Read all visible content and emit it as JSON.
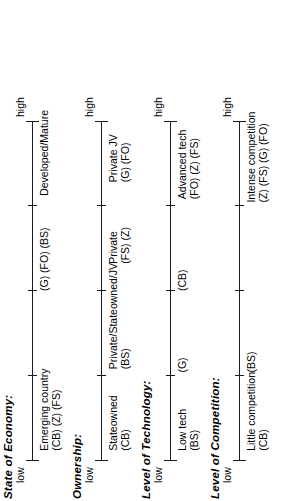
{
  "figure": {
    "orientation": "rotated-90-ccw",
    "scales": [
      {
        "id": "state-of-economy",
        "title": "State of Economy:",
        "low_label": "low",
        "high_label": "high",
        "ticks": [
          0,
          25,
          50,
          75,
          100
        ],
        "annotations": [
          {
            "id": "emerging-country",
            "position": 3,
            "text": "Emerging country",
            "codes": "(CB) (Z) (FS)"
          },
          {
            "id": "mid-codes",
            "position": 50,
            "text": "",
            "codes": "(G) (FO) (BS)"
          },
          {
            "id": "developed-mature",
            "position": 78,
            "text": "Developed/Mature",
            "codes": ""
          }
        ]
      },
      {
        "id": "ownership",
        "title": "Ownership:",
        "low_label": "low",
        "high_label": "high",
        "ticks": [
          0,
          25,
          50,
          75,
          100
        ],
        "annotations": [
          {
            "id": "stateowned",
            "position": 3,
            "text": "Stateowned",
            "codes": "(CB)"
          },
          {
            "id": "private-stateowned-jv",
            "position": 27,
            "text": "Private/Stateowned/JV",
            "codes": "(BS)"
          },
          {
            "id": "private",
            "position": 58,
            "text": "Private",
            "codes": "(FS) (Z)"
          },
          {
            "id": "private-jv",
            "position": 82,
            "text": "Private JV",
            "codes": "(G) (FO)"
          }
        ]
      },
      {
        "id": "level-of-technology",
        "title": "Level of Technology:",
        "low_label": "low",
        "high_label": "high",
        "ticks": [
          0,
          25,
          50,
          75,
          100
        ],
        "annotations": [
          {
            "id": "low-tech",
            "position": 3,
            "text": "Low tech",
            "codes": "(BS)"
          },
          {
            "id": "g-code",
            "position": 26,
            "text": "",
            "codes": "(G)"
          },
          {
            "id": "cb-code",
            "position": 50,
            "text": "",
            "codes": "(CB)"
          },
          {
            "id": "advanced-tech",
            "position": 77,
            "text": "Advanced tech",
            "codes": "(FO) (Z) (FS)"
          }
        ]
      },
      {
        "id": "level-of-competition",
        "title": "Level of Competition:",
        "low_label": "low",
        "high_label": "high",
        "ticks": [
          0,
          25,
          50,
          75,
          100
        ],
        "annotations": [
          {
            "id": "little-competition",
            "position": 3,
            "text": "Little competition",
            "codes": "(CB)"
          },
          {
            "id": "bs-code",
            "position": 26,
            "text": "",
            "codes": "(BS)"
          },
          {
            "id": "intense-competition",
            "position": 76,
            "text": "Intense competition",
            "codes": "(Z) (FS) (G) (FO)"
          }
        ]
      }
    ]
  }
}
